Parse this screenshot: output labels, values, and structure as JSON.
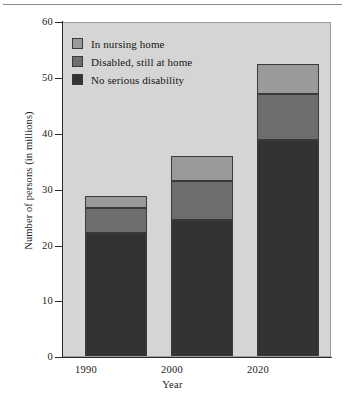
{
  "chart_data": {
    "type": "bar",
    "subtype": "stacked-bar",
    "title": "",
    "xlabel": "Year",
    "ylabel": "Number of persons (in millions)",
    "categories": [
      "1990",
      "2000",
      "2020"
    ],
    "ylim": [
      0,
      60
    ],
    "yticks": [
      0,
      10,
      20,
      30,
      40,
      50,
      60
    ],
    "ytick_labels": [
      "0",
      "10",
      "20",
      "30",
      "40",
      "50",
      "60"
    ],
    "grid": false,
    "legend_position": "upper-left",
    "series": [
      {
        "name": "No serious disability",
        "color": "#333333",
        "values": [
          22.0,
          24.3,
          38.7
        ]
      },
      {
        "name": "Disabled, still at home",
        "color": "#6e6e6e",
        "values": [
          4.5,
          7.0,
          8.2
        ]
      },
      {
        "name": "In nursing home",
        "color": "#9a9a9a",
        "values": [
          2.2,
          4.6,
          5.4
        ]
      }
    ],
    "totals": [
      28.7,
      35.9,
      52.3
    ],
    "stack_order_bottom_to_top": [
      "No serious disability",
      "Disabled, still at home",
      "In nursing home"
    ]
  },
  "legend": {
    "items": [
      {
        "label": "In nursing home",
        "color": "#9a9a9a"
      },
      {
        "label": "Disabled, still at home",
        "color": "#6e6e6e"
      },
      {
        "label": "No serious disability",
        "color": "#333333"
      }
    ]
  },
  "colors": {
    "plot_background": "#d5d5d5",
    "figure_background": "#ffffff",
    "axis": "#2b2b2b",
    "segment_border": "#3a3a3a",
    "rule": "#8d8d8d"
  }
}
